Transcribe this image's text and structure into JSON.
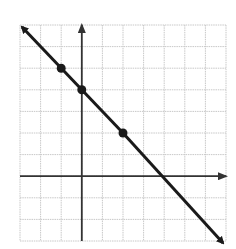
{
  "chart_data": {
    "type": "line",
    "title": "",
    "xlabel": "",
    "ylabel": "",
    "xlim": [
      -3,
      7
    ],
    "ylim": [
      -3,
      7
    ],
    "grid": true,
    "grid_step": 1,
    "series": [
      {
        "name": "line",
        "equation": "y = -x + 4",
        "slope": -1,
        "intercept": 4,
        "endpoints": [
          [
            -3,
            7
          ],
          [
            7,
            -3
          ]
        ],
        "marked_points": [
          [
            -1,
            5
          ],
          [
            0,
            4
          ],
          [
            2,
            2
          ]
        ],
        "color": "#1a1a1a"
      }
    ],
    "axes": {
      "x_arrow": true,
      "y_arrow": true,
      "color": "#333333"
    },
    "grid_color": "#c8c8c8"
  },
  "layout": {
    "px_left": 20,
    "px_right": 226,
    "px_top": 25,
    "px_bottom": 241
  }
}
